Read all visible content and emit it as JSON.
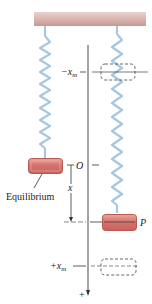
{
  "figure": {
    "labels": {
      "neg_xm": "−x",
      "neg_xm_sub": "m",
      "origin": "O",
      "x": "x",
      "equilibrium": "Equilibrium",
      "P": "P",
      "pos_xm": "+x",
      "pos_xm_sub": "m",
      "axis_plus": "+"
    },
    "colors": {
      "ceiling_top": "#e8c8c4",
      "ceiling_bottom": "#c89890",
      "spring": "#a8c8e4",
      "block_fill": "#d4736c",
      "block_light": "#e9a7a0",
      "block_edge": "#b8584f",
      "line": "#333333",
      "dashed": "#555555"
    }
  }
}
